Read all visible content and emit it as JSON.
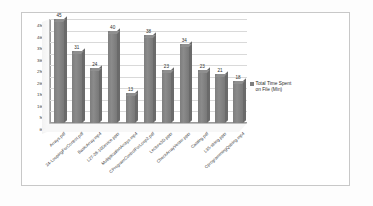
{
  "chart_data": {
    "type": "bar",
    "title": "",
    "xlabel": "",
    "ylabel": "",
    "ylim": [
      0,
      45
    ],
    "yticks": [
      0,
      5,
      10,
      15,
      20,
      25,
      30,
      35,
      40,
      45
    ],
    "grid": true,
    "legend_position": "right",
    "three_d": true,
    "categories": [
      "Arrays.pdf",
      "24-LoopingForControl.pdf",
      "BasicArray.mp4",
      "L27-28-10Device.pptx",
      "MultiplicationArrays.mp4",
      "CProgramControlForLoop2.pdf",
      "Lecture3D.pptx",
      "CheckArrayVector.pptx",
      "Casting.pdf",
      "L35-string.pptx",
      "CprogrammingQstring.mp4"
    ],
    "series": [
      {
        "name": "Total Time Spent on File (Min)",
        "values": [
          45,
          31,
          24,
          40,
          13,
          38,
          23,
          34,
          23,
          21,
          18
        ]
      }
    ],
    "legend_entries": [
      "Total Time Spent\non File (Min)"
    ],
    "colors": {
      "bar": "#7e7e7e",
      "bar_top": "#8f8f8f",
      "bar_side": "#6a6a6a",
      "gridline": "#d9d9d9",
      "axis": "#9a9a9a",
      "frame": "#c8c8c8",
      "text": "#2d2d2d",
      "background": "#ffffff"
    }
  }
}
